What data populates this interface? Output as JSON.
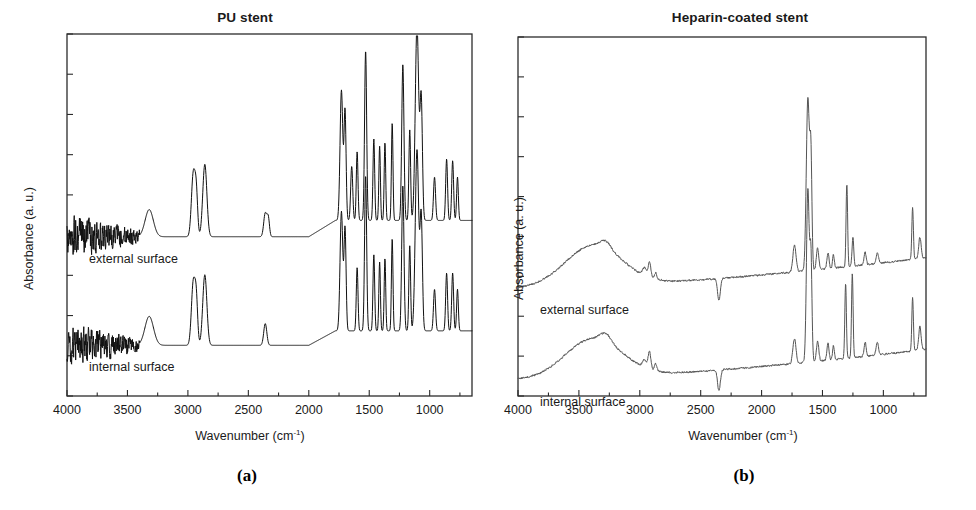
{
  "figure": {
    "panels": [
      {
        "id": "a",
        "caption": "(a)",
        "title": "PU stent",
        "ylabel": "Absorbance (a. u.)",
        "xlabel_text": "Wavenumber (cm",
        "xlabel_sup": "-1",
        "xlabel_close": ")",
        "trace_labels": {
          "external": "external surface",
          "internal": "internal surface"
        },
        "xticks": [
          4000,
          3500,
          3000,
          2500,
          2000,
          1500,
          1000
        ],
        "xticks_minor": [
          3750,
          3250,
          2750,
          2250,
          1750,
          1250,
          750
        ],
        "xlim": [
          4000,
          650
        ],
        "yticks_count": 9,
        "line_color": "#111111",
        "line_width": 1.0
      },
      {
        "id": "b",
        "caption": "(b)",
        "title": "Heparin-coated stent",
        "ylabel": "Absorbance (a. u.)",
        "xlabel_text": "Wavenumber (cm",
        "xlabel_sup": "-1",
        "xlabel_close": ")",
        "trace_labels": {
          "external": "external surface",
          "internal": "internal surface"
        },
        "xticks": [
          4000,
          3500,
          3000,
          2500,
          2000,
          1500,
          1000
        ],
        "xticks_minor": [
          3750,
          3250,
          2750,
          2250,
          1750,
          1250,
          750
        ],
        "xlim": [
          4000,
          650
        ],
        "yticks_count": 9,
        "line_color": "#555555",
        "line_width": 1.0
      }
    ]
  },
  "chart_data": [
    {
      "type": "line",
      "panel": "a",
      "title": "PU stent",
      "xlabel": "Wavenumber (cm-1)",
      "ylabel": "Absorbance (a. u.)",
      "xlim": [
        4000,
        650
      ],
      "ylim": [
        0,
        1
      ],
      "grid": false,
      "legend": "inline-annotations",
      "xticks": [
        4000,
        3500,
        3000,
        2500,
        2000,
        1500,
        1000
      ],
      "annotations": [
        "external surface",
        "internal surface"
      ],
      "series": [
        {
          "name": "external surface",
          "baseline": 0.44,
          "noise_region": [
            4000,
            3400
          ],
          "noise_amplitude": 0.055,
          "peaks": [
            {
              "x": 3320,
              "h": 0.075,
              "w": 48
            },
            {
              "x": 2955,
              "h": 0.175,
              "w": 22
            },
            {
              "x": 2930,
              "h": 0.105,
              "w": 16
            },
            {
              "x": 2860,
              "h": 0.2,
              "w": 24
            },
            {
              "x": 2360,
              "h": 0.065,
              "w": 18
            },
            {
              "x": 2335,
              "h": 0.05,
              "w": 14
            },
            {
              "x": 1730,
              "h": 0.36,
              "w": 16
            },
            {
              "x": 1700,
              "h": 0.3,
              "w": 12
            },
            {
              "x": 1645,
              "h": 0.15,
              "w": 12
            },
            {
              "x": 1600,
              "h": 0.19,
              "w": 10
            },
            {
              "x": 1530,
              "h": 0.47,
              "w": 12
            },
            {
              "x": 1462,
              "h": 0.225,
              "w": 10
            },
            {
              "x": 1414,
              "h": 0.205,
              "w": 9
            },
            {
              "x": 1370,
              "h": 0.215,
              "w": 9
            },
            {
              "x": 1310,
              "h": 0.27,
              "w": 9
            },
            {
              "x": 1222,
              "h": 0.43,
              "w": 13
            },
            {
              "x": 1165,
              "h": 0.25,
              "w": 10
            },
            {
              "x": 1105,
              "h": 0.54,
              "w": 20
            },
            {
              "x": 1070,
              "h": 0.33,
              "w": 14
            },
            {
              "x": 960,
              "h": 0.12,
              "w": 12
            },
            {
              "x": 860,
              "h": 0.17,
              "w": 11
            },
            {
              "x": 810,
              "h": 0.165,
              "w": 11
            },
            {
              "x": 770,
              "h": 0.12,
              "w": 10
            }
          ],
          "broad_rise": {
            "from": 2000,
            "to": 1780,
            "amount": 0.045
          }
        },
        {
          "name": "internal surface",
          "baseline": 0.14,
          "noise_region": [
            4000,
            3400
          ],
          "noise_amplitude": 0.052,
          "peaks": [
            {
              "x": 3320,
              "h": 0.08,
              "w": 50
            },
            {
              "x": 2955,
              "h": 0.175,
              "w": 22
            },
            {
              "x": 2930,
              "h": 0.11,
              "w": 16
            },
            {
              "x": 2860,
              "h": 0.195,
              "w": 24
            },
            {
              "x": 2360,
              "h": 0.06,
              "w": 18
            },
            {
              "x": 1730,
              "h": 0.33,
              "w": 16
            },
            {
              "x": 1700,
              "h": 0.28,
              "w": 12
            },
            {
              "x": 1600,
              "h": 0.175,
              "w": 10
            },
            {
              "x": 1530,
              "h": 0.43,
              "w": 12
            },
            {
              "x": 1462,
              "h": 0.21,
              "w": 10
            },
            {
              "x": 1414,
              "h": 0.19,
              "w": 9
            },
            {
              "x": 1370,
              "h": 0.2,
              "w": 9
            },
            {
              "x": 1310,
              "h": 0.255,
              "w": 9
            },
            {
              "x": 1222,
              "h": 0.4,
              "w": 13
            },
            {
              "x": 1165,
              "h": 0.235,
              "w": 10
            },
            {
              "x": 1105,
              "h": 0.5,
              "w": 20
            },
            {
              "x": 1070,
              "h": 0.31,
              "w": 14
            },
            {
              "x": 960,
              "h": 0.115,
              "w": 12
            },
            {
              "x": 860,
              "h": 0.16,
              "w": 11
            },
            {
              "x": 810,
              "h": 0.16,
              "w": 11
            },
            {
              "x": 770,
              "h": 0.115,
              "w": 10
            }
          ],
          "broad_rise": {
            "from": 2000,
            "to": 1780,
            "amount": 0.04
          }
        }
      ]
    },
    {
      "type": "line",
      "panel": "b",
      "title": "Heparin-coated stent",
      "xlabel": "Wavenumber (cm-1)",
      "ylabel": "Absorbance (a. u.)",
      "xlim": [
        4000,
        650
      ],
      "ylim": [
        0,
        1
      ],
      "grid": false,
      "legend": "inline-annotations",
      "xticks": [
        4000,
        3500,
        3000,
        2500,
        2000,
        1500,
        1000
      ],
      "annotations": [
        "external surface",
        "internal surface"
      ],
      "series": [
        {
          "name": "external surface",
          "baseline": 0.3,
          "broad_oh": {
            "center": 3380,
            "height": 0.115,
            "width": 330
          },
          "slope_start": 0.0,
          "slope_end": 0.085,
          "peaks": [
            {
              "x": 3280,
              "h": 0.02,
              "w": 60
            },
            {
              "x": 2960,
              "h": 0.022,
              "w": 24
            },
            {
              "x": 2920,
              "h": 0.04,
              "w": 16
            },
            {
              "x": 2870,
              "h": 0.018,
              "w": 14
            },
            {
              "x": 1730,
              "h": 0.075,
              "w": 18
            },
            {
              "x": 1620,
              "h": 0.48,
              "w": 18
            },
            {
              "x": 1595,
              "h": 0.3,
              "w": 12
            },
            {
              "x": 1540,
              "h": 0.06,
              "w": 14
            },
            {
              "x": 1455,
              "h": 0.045,
              "w": 12
            },
            {
              "x": 1410,
              "h": 0.038,
              "w": 10
            },
            {
              "x": 1300,
              "h": 0.23,
              "w": 9
            },
            {
              "x": 1250,
              "h": 0.08,
              "w": 10
            },
            {
              "x": 1150,
              "h": 0.035,
              "w": 12
            },
            {
              "x": 1050,
              "h": 0.03,
              "w": 14
            },
            {
              "x": 760,
              "h": 0.145,
              "w": 9
            },
            {
              "x": 700,
              "h": 0.06,
              "w": 14
            }
          ],
          "negative_peaks": [
            {
              "x": 2350,
              "h": 0.06,
              "w": 16
            }
          ]
        },
        {
          "name": "internal surface",
          "baseline": 0.045,
          "broad_oh": {
            "center": 3380,
            "height": 0.11,
            "width": 330
          },
          "slope_start": 0.0,
          "slope_end": 0.085,
          "peaks": [
            {
              "x": 3280,
              "h": 0.022,
              "w": 60
            },
            {
              "x": 2960,
              "h": 0.022,
              "w": 24
            },
            {
              "x": 2920,
              "h": 0.048,
              "w": 16
            },
            {
              "x": 2870,
              "h": 0.02,
              "w": 14
            },
            {
              "x": 1730,
              "h": 0.07,
              "w": 18
            },
            {
              "x": 1620,
              "h": 0.48,
              "w": 16
            },
            {
              "x": 1595,
              "h": 0.29,
              "w": 12
            },
            {
              "x": 1540,
              "h": 0.055,
              "w": 14
            },
            {
              "x": 1455,
              "h": 0.05,
              "w": 12
            },
            {
              "x": 1410,
              "h": 0.04,
              "w": 10
            },
            {
              "x": 1310,
              "h": 0.21,
              "w": 9
            },
            {
              "x": 1255,
              "h": 0.235,
              "w": 9
            },
            {
              "x": 1150,
              "h": 0.04,
              "w": 12
            },
            {
              "x": 1050,
              "h": 0.035,
              "w": 14
            },
            {
              "x": 760,
              "h": 0.15,
              "w": 9
            },
            {
              "x": 700,
              "h": 0.065,
              "w": 14
            }
          ],
          "negative_peaks": [
            {
              "x": 2350,
              "h": 0.058,
              "w": 16
            }
          ]
        }
      ]
    }
  ]
}
